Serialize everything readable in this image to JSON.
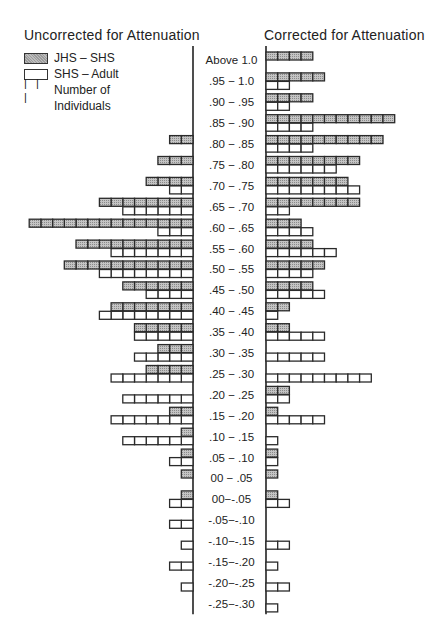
{
  "chart_data": {
    "type": "bar",
    "orientation": "horizontal-back-to-back",
    "unit_label": "Number of Individuals",
    "categories": [
      "Above 1.0",
      ".95 − 1.0",
      ".90 − .95",
      ".85 − .90",
      ".80 − .85",
      ".75 − .80",
      ".70 − .75",
      ".65 − .70",
      ".60 − .65",
      ".55 − .60",
      ".50 − .55",
      ".45 − .50",
      ".40 − .45",
      ".35 − .40",
      ".30 − .35",
      ".25 − .30",
      ".20 − .25",
      ".15 − .20",
      ".10 − .15",
      ".05 − .10",
      "00 − .05",
      "00−-.05",
      "-.05−-.10",
      "-.10−-.15",
      "-.15−-.20",
      "-.20−-.25",
      "-.25−-.30"
    ],
    "panels": [
      {
        "title": "Uncorrected for Attenuation",
        "side": "left",
        "series": [
          {
            "name": "JHS – SHS",
            "values": [
              0,
              0,
              0,
              0,
              2,
              3,
              4,
              8,
              14,
              10,
              11,
              6,
              7,
              5,
              3,
              4,
              0,
              2,
              1,
              1,
              1,
              1,
              0,
              0,
              0,
              0,
              0
            ]
          },
          {
            "name": "SHS – Adult",
            "values": [
              0,
              0,
              0,
              0,
              0,
              0,
              2,
              6,
              3,
              7,
              8,
              4,
              8,
              5,
              5,
              7,
              6,
              7,
              6,
              2,
              0,
              2,
              2,
              1,
              2,
              1,
              0
            ]
          }
        ]
      },
      {
        "title": "Corrected for Attenuation",
        "side": "right",
        "series": [
          {
            "name": "JHS – SHS",
            "values": [
              4,
              5,
              4,
              11,
              10,
              8,
              7,
              8,
              3,
              4,
              5,
              4,
              2,
              2,
              0,
              0,
              2,
              1,
              0,
              1,
              1,
              1,
              0,
              0,
              0,
              0,
              0
            ]
          },
          {
            "name": "SHS – Adult",
            "values": [
              0,
              2,
              2,
              4,
              4,
              6,
              8,
              2,
              4,
              6,
              4,
              5,
              1,
              5,
              5,
              9,
              2,
              5,
              1,
              1,
              0,
              2,
              0,
              2,
              1,
              2,
              1
            ]
          }
        ]
      }
    ],
    "legend": {
      "placement": "top-left",
      "entries": [
        "JHS – SHS",
        "SHS – Adult",
        "Number of Individuals"
      ]
    },
    "grid": false
  },
  "titles": {
    "left": "Uncorrected for Attenuation",
    "right": "Corrected for Attenuation"
  },
  "legend": {
    "jhs": "JHS – SHS",
    "shs": "SHS – Adult",
    "ticks": "| | |",
    "count1": "Number of",
    "count2": "Individuals"
  }
}
